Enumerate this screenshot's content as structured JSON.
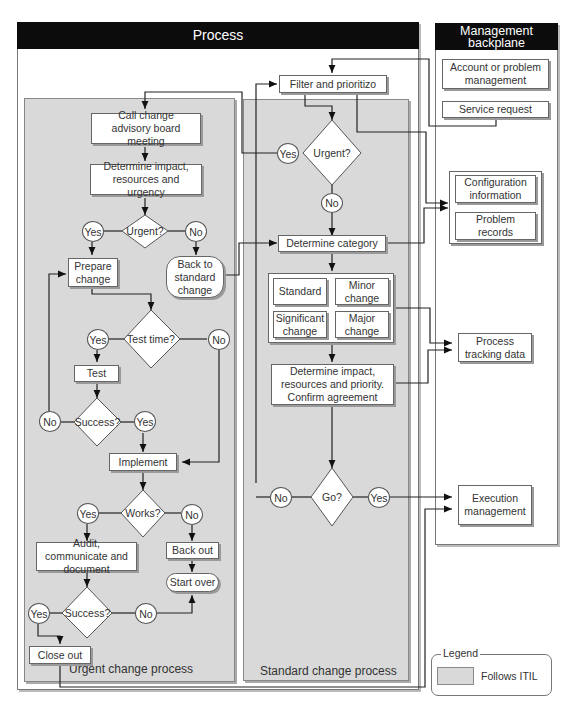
{
  "process": {
    "header": "Process",
    "urgent_panel_label": "Urgent change process",
    "standard_panel_label": "Standard change process",
    "urgent": {
      "call_cab": "Call change advisory board meeting",
      "determine_impact": "Determine impact, resources and urgency",
      "urgent_q": "Urgent?",
      "yes": "Yes",
      "no": "No",
      "prepare_change": "Prepare change",
      "back_to_standard": "Back to standard change",
      "test_time_q": "Test time?",
      "test": "Test",
      "success_q": "Success?",
      "implement": "Implement",
      "works_q": "Works?",
      "audit": "Audit, communicate and document",
      "back_out": "Back out",
      "start_over": "Start over",
      "close_out": "Close out"
    },
    "standard": {
      "filter": "Filter and prioritizo",
      "urgent_q": "Urgent?",
      "yes": "Yes",
      "no": "No",
      "determine_category": "Determine category",
      "categories": [
        "Standard",
        "Minor change",
        "Significant change",
        "Major change"
      ],
      "determine_impact": "Determine impact, resources and priority. Confirm agreement",
      "go_q": "Go?"
    }
  },
  "backplane": {
    "header": "Management backplane",
    "account": "Account or problem management",
    "service_request": "Service request",
    "configuration": "Configuration information",
    "problem_records": "Problem records",
    "process_tracking": "Process tracking data",
    "execution": "Execution management"
  },
  "legend": {
    "title": "Legend",
    "follows_itil": "Follows ITIL",
    "swatch_color": "#d9d9d9"
  }
}
